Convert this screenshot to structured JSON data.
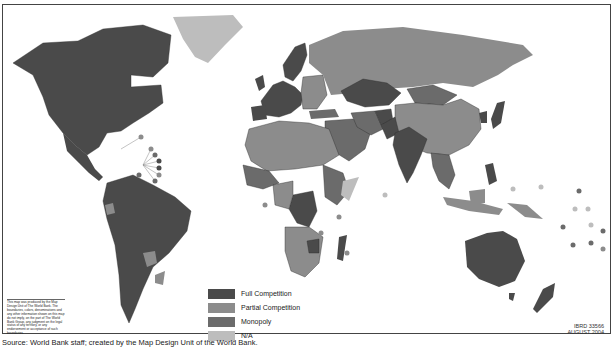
{
  "map": {
    "title": "World map of telecommunications market competition",
    "legend": [
      {
        "label": "Full Competition",
        "color": "#4a4a4a"
      },
      {
        "label": "Partial Competition",
        "color": "#8c8c8c"
      },
      {
        "label": "Monopoly",
        "color": "#6b6b6b"
      },
      {
        "label": "N/A",
        "color": "#bdbdbd"
      }
    ],
    "colors": {
      "full": "#4a4a4a",
      "partial": "#8c8c8c",
      "monopoly": "#6b6b6b",
      "na": "#bdbdbd",
      "border": "#2a2a2a",
      "ocean": "#ffffff"
    },
    "disclaimer": "This map was produced by the Map Design Unit of The World Bank. The boundaries, colors, denominations and any other information shown on this map do not imply, on the part of The World Bank Group, any judgment on the legal status of any territory, or any endorsement or acceptance of such boundaries.",
    "map_id": "IBRD 33566",
    "date": "AUGUST 2004"
  },
  "source": "Source: World Bank staff; created by the Map Design Unit of the World Bank."
}
